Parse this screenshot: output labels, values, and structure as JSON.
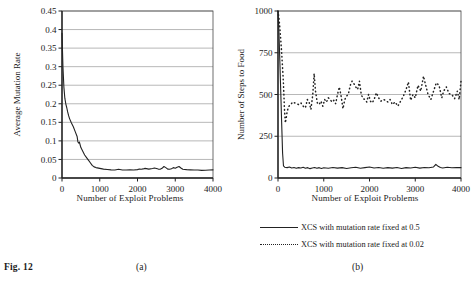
{
  "figure": {
    "caption_label": "Fig. 12",
    "panel_a_label": "(a)",
    "panel_b_label": "(b)"
  },
  "legend": {
    "entries": [
      {
        "style": "solid",
        "label": "XCS with mutation rate fixed at 0.5"
      },
      {
        "style": "dotted",
        "label": "XCS with mutation rate fixed at 0.02"
      }
    ]
  },
  "chart_data": [
    {
      "id": "panel-a",
      "type": "line",
      "title": "",
      "xlabel": "Number of Exploit Problems",
      "ylabel": "Average Mutation Rate",
      "xlim": [
        0,
        4000
      ],
      "ylim": [
        0,
        0.45
      ],
      "xticks": [
        0,
        1000,
        2000,
        3000,
        4000
      ],
      "xtick_labels": [
        "0",
        "1000",
        "2000",
        "3000",
        "4000"
      ],
      "yticks": [
        0,
        0.05,
        0.1,
        0.15,
        0.2,
        0.25,
        0.3,
        0.35,
        0.4,
        0.45
      ],
      "ytick_labels": [
        "0",
        "0.05",
        "0.1",
        "0.15",
        "0.2",
        "0.25",
        "0.3",
        "0.35",
        "0.4",
        "0.45"
      ],
      "grid": "horizontal",
      "legend_position": "none",
      "series": [
        {
          "name": "Average mutation rate",
          "style": "solid",
          "x": [
            0,
            25,
            50,
            75,
            100,
            125,
            150,
            175,
            200,
            250,
            300,
            350,
            400,
            420,
            440,
            460,
            500,
            550,
            600,
            650,
            700,
            750,
            800,
            850,
            900,
            1000,
            1100,
            1200,
            1300,
            1400,
            1500,
            1600,
            1700,
            1800,
            1900,
            2000,
            2050,
            2100,
            2150,
            2200,
            2300,
            2400,
            2450,
            2500,
            2550,
            2600,
            2650,
            2700,
            2750,
            2800,
            2850,
            2900,
            2950,
            3000,
            3050,
            3100,
            3150,
            3200,
            3300,
            3400,
            3500,
            3600,
            3700,
            3800,
            3900,
            4000
          ],
          "y": [
            0.39,
            0.3,
            0.245,
            0.215,
            0.2,
            0.19,
            0.178,
            0.168,
            0.16,
            0.148,
            0.138,
            0.125,
            0.112,
            0.098,
            0.094,
            0.097,
            0.082,
            0.072,
            0.062,
            0.055,
            0.048,
            0.041,
            0.034,
            0.03,
            0.028,
            0.026,
            0.024,
            0.023,
            0.022,
            0.0215,
            0.0235,
            0.0215,
            0.0215,
            0.022,
            0.0215,
            0.0225,
            0.024,
            0.0235,
            0.0245,
            0.026,
            0.024,
            0.0255,
            0.027,
            0.0255,
            0.024,
            0.0235,
            0.026,
            0.031,
            0.028,
            0.024,
            0.0235,
            0.025,
            0.028,
            0.0265,
            0.029,
            0.031,
            0.027,
            0.0235,
            0.0225,
            0.022,
            0.0215,
            0.0215,
            0.0205,
            0.021,
            0.0215,
            0.022
          ]
        }
      ]
    },
    {
      "id": "panel-b",
      "type": "line",
      "title": "",
      "xlabel": "Number of Exploit Problems",
      "ylabel": "Number of Steps to Food",
      "xlim": [
        0,
        4000
      ],
      "ylim": [
        0,
        1000
      ],
      "xticks": [
        0,
        1000,
        2000,
        3000,
        4000
      ],
      "xtick_labels": [
        "0",
        "1000",
        "2000",
        "3000",
        "4000"
      ],
      "yticks": [
        0,
        250,
        500,
        750,
        1000
      ],
      "ytick_labels": [
        "0",
        "250",
        "500",
        "750",
        "1000"
      ],
      "grid": "horizontal",
      "legend_position": "below",
      "series": [
        {
          "name": "XCS with mutation rate fixed at 0.5",
          "style": "solid",
          "x": [
            0,
            20,
            40,
            60,
            80,
            100,
            120,
            150,
            200,
            250,
            300,
            350,
            400,
            450,
            500,
            550,
            600,
            650,
            700,
            750,
            800,
            850,
            900,
            950,
            1000,
            1100,
            1200,
            1300,
            1400,
            1500,
            1600,
            1700,
            1800,
            1900,
            2000,
            2100,
            2200,
            2300,
            2400,
            2500,
            2600,
            2700,
            2800,
            2900,
            3000,
            3100,
            3200,
            3300,
            3400,
            3450,
            3500,
            3550,
            3600,
            3700,
            3800,
            3900,
            4000
          ],
          "y": [
            1000,
            880,
            700,
            520,
            330,
            150,
            72,
            64,
            62,
            66,
            60,
            63,
            58,
            62,
            60,
            64,
            58,
            62,
            56,
            60,
            63,
            58,
            62,
            57,
            61,
            58,
            63,
            59,
            62,
            57,
            61,
            64,
            58,
            62,
            66,
            60,
            63,
            58,
            62,
            59,
            63,
            57,
            62,
            60,
            64,
            59,
            63,
            61,
            66,
            82,
            70,
            63,
            60,
            64,
            61,
            63,
            62
          ]
        },
        {
          "name": "XCS with mutation rate fixed at 0.02",
          "style": "dotted",
          "x": [
            0,
            20,
            40,
            60,
            80,
            100,
            120,
            140,
            160,
            180,
            200,
            240,
            280,
            320,
            360,
            400,
            450,
            500,
            550,
            600,
            640,
            680,
            720,
            760,
            790,
            820,
            860,
            900,
            940,
            980,
            1020,
            1060,
            1100,
            1140,
            1180,
            1220,
            1260,
            1300,
            1340,
            1380,
            1420,
            1460,
            1500,
            1540,
            1580,
            1620,
            1660,
            1700,
            1740,
            1780,
            1820,
            1860,
            1900,
            1940,
            1980,
            2020,
            2060,
            2100,
            2150,
            2200,
            2250,
            2300,
            2350,
            2400,
            2450,
            2500,
            2560,
            2620,
            2680,
            2740,
            2800,
            2850,
            2900,
            2950,
            3000,
            3060,
            3120,
            3180,
            3220,
            3280,
            3340,
            3400,
            3460,
            3520,
            3580,
            3620,
            3680,
            3740,
            3800,
            3860,
            3920,
            3960,
            4000
          ],
          "y": [
            1000,
            960,
            900,
            830,
            750,
            660,
            560,
            420,
            330,
            360,
            400,
            430,
            440,
            455,
            450,
            445,
            440,
            450,
            430,
            420,
            470,
            455,
            410,
            500,
            625,
            520,
            450,
            440,
            460,
            430,
            470,
            455,
            480,
            470,
            455,
            465,
            445,
            500,
            545,
            490,
            415,
            470,
            490,
            505,
            555,
            580,
            565,
            545,
            530,
            580,
            500,
            475,
            470,
            455,
            500,
            460,
            450,
            470,
            510,
            480,
            460,
            470,
            465,
            455,
            470,
            440,
            455,
            430,
            460,
            490,
            530,
            575,
            465,
            500,
            480,
            555,
            520,
            610,
            565,
            500,
            470,
            520,
            570,
            555,
            480,
            520,
            545,
            505,
            500,
            475,
            520,
            470,
            580,
            640
          ]
        }
      ]
    }
  ]
}
